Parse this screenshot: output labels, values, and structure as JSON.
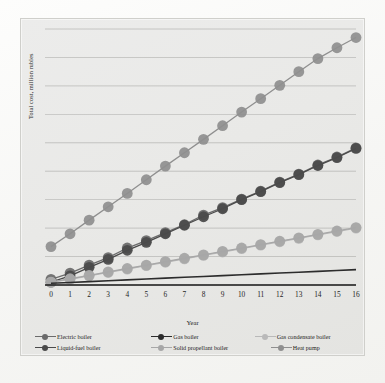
{
  "axes": {
    "ylabel": "Total cost, million rubles",
    "xlabel": "Year"
  },
  "legend": {
    "row1": [
      {
        "label": "Electric boiler",
        "key": "electric-boiler"
      },
      {
        "label": "Gas  boiler",
        "key": "gas-boiler"
      },
      {
        "label": "Gas condensate boiler",
        "key": "gas-condensate-boiler"
      }
    ],
    "row2": [
      {
        "label": "Liquid-fuel boiler",
        "key": "liquid-fuel-boiler"
      },
      {
        "label": "Solid propellant boiler",
        "key": "solid-propellant-boiler"
      },
      {
        "label": "Heat pump",
        "key": "heat-pump"
      }
    ]
  },
  "colors": {
    "electric_boiler": "#6b6b6b",
    "gas_boiler": "#2c2c2c",
    "gas_condensate_boiler": "#b9b9b9",
    "liquid_fuel_boiler": "#4a4a4a",
    "solid_propellant_boiler": "#a7a7a7",
    "heat_pump": "#8f8f8f",
    "gridline": "#9a9a96",
    "plot_background": "#e9e9e7",
    "axis": "#1a1a1a"
  },
  "chart_data": {
    "type": "line",
    "title": "",
    "xlabel": "Year",
    "ylabel": "Total cost, million rubles",
    "x": [
      0,
      1,
      2,
      3,
      4,
      5,
      6,
      7,
      8,
      9,
      10,
      11,
      12,
      13,
      14,
      15,
      16
    ],
    "xlim": [
      0,
      16
    ],
    "ylim": [
      0,
      90
    ],
    "xtick_labels": [
      "0",
      "1",
      "2",
      "3",
      "4",
      "5",
      "6",
      "7",
      "8",
      "9",
      "10",
      "11",
      "12",
      "13",
      "14",
      "15",
      "16"
    ],
    "ytick_labels": [],
    "grid": "horizontal",
    "legend_position": "bottom",
    "marker": "circle",
    "series": [
      {
        "name": "Electric boiler",
        "color": "#6b6b6b",
        "values": [
          2.0,
          4.2,
          7.0,
          9.6,
          13.0,
          15.6,
          18.4,
          21.2,
          24.6,
          27.2,
          30.2,
          33.0,
          36.2,
          39.0,
          42.2,
          45.0,
          48.2
        ]
      },
      {
        "name": "Gas  boiler",
        "color": "#2c2c2c",
        "values": [
          0.6,
          0.9,
          1.2,
          1.5,
          1.8,
          2.1,
          2.4,
          2.7,
          3.0,
          3.3,
          3.6,
          3.9,
          4.2,
          4.5,
          4.8,
          5.1,
          5.4
        ]
      },
      {
        "name": "Gas condensate boiler",
        "color": "#b9b9b9",
        "values": [
          1.0,
          2.0,
          3.2,
          4.4,
          5.6,
          6.8,
          8.0,
          9.2,
          10.4,
          11.6,
          12.8,
          14.0,
          15.2,
          16.4,
          17.6,
          18.8,
          20.0
        ]
      },
      {
        "name": "Liquid-fuel boiler",
        "color": "#4a4a4a",
        "values": [
          1.0,
          3.2,
          6.2,
          9.0,
          12.2,
          15.0,
          18.0,
          21.0,
          24.0,
          26.8,
          30.0,
          32.8,
          36.0,
          38.8,
          42.0,
          44.8,
          48.0
        ]
      },
      {
        "name": "Solid propellant boiler",
        "color": "#a7a7a7",
        "values": [
          1.0,
          2.2,
          3.4,
          4.6,
          5.8,
          7.0,
          8.2,
          9.4,
          10.6,
          11.8,
          13.0,
          14.2,
          15.4,
          16.6,
          17.8,
          19.0,
          20.2
        ]
      },
      {
        "name": "Heat pump",
        "color": "#8f8f8f",
        "values": [
          13.5,
          18.0,
          22.8,
          27.5,
          32.2,
          37.0,
          41.8,
          46.5,
          51.2,
          56.0,
          60.8,
          65.5,
          70.2,
          75.0,
          79.6,
          83.4,
          87.0
        ]
      }
    ]
  }
}
